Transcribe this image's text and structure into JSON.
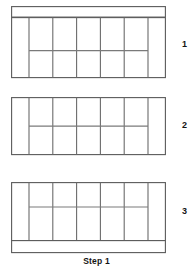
{
  "caption": "Step 1",
  "colors": {
    "background": "#ffffff",
    "line": "#5a5a5a",
    "mullion": "#6b6b6b",
    "transom": "#7a7a7a",
    "text": "#141414"
  },
  "figures": [
    {
      "label": "1",
      "has_top_bar": true,
      "has_bottom_bar": false,
      "columns": 5,
      "side_posts": 2,
      "transom_position_pct": 55,
      "width": 155,
      "height": 60,
      "bar_height": 11
    },
    {
      "label": "2",
      "has_top_bar": false,
      "has_bottom_bar": false,
      "columns": 5,
      "side_posts": 2,
      "transom_position_pct": 50,
      "width": 155,
      "height": 57,
      "bar_height": 0
    },
    {
      "label": "3",
      "has_top_bar": false,
      "has_bottom_bar": true,
      "columns": 5,
      "side_posts": 2,
      "transom_position_pct": 42,
      "width": 155,
      "height": 58,
      "bar_height": 12
    }
  ]
}
